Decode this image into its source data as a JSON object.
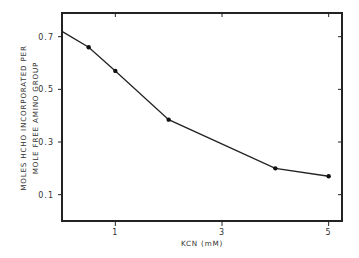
{
  "chart_data": {
    "type": "line",
    "title": "",
    "xlabel": "KCN (mM)",
    "ylabel_lines": [
      "MOLES HCHO INCORPORATED PER",
      "MOLE FREE AMINO GROUP"
    ],
    "ylabel": "MOLES HCHO INCORPORATED PER MOLE FREE AMINO GROUP",
    "xlim": [
      0,
      5.25
    ],
    "ylim": [
      0,
      0.79
    ],
    "x_ticks": [
      1,
      3,
      5
    ],
    "x_tick_labels": [
      "1",
      "3",
      "5"
    ],
    "y_ticks": [
      0.1,
      0.3,
      0.5,
      0.7
    ],
    "y_tick_labels": [
      "0.1",
      "0.3",
      "0.5",
      "0.7"
    ],
    "grid": false,
    "legend": null,
    "series": [
      {
        "name": "HCHO incorporation",
        "x": [
          0,
          0.5,
          1,
          2,
          4,
          5
        ],
        "values": [
          0.72,
          0.66,
          0.57,
          0.385,
          0.2,
          0.17
        ],
        "markers": [
          false,
          true,
          true,
          true,
          true,
          true
        ]
      }
    ],
    "colors": {
      "line": "#222222",
      "axis": "#222222",
      "background": "#ffffff"
    }
  }
}
